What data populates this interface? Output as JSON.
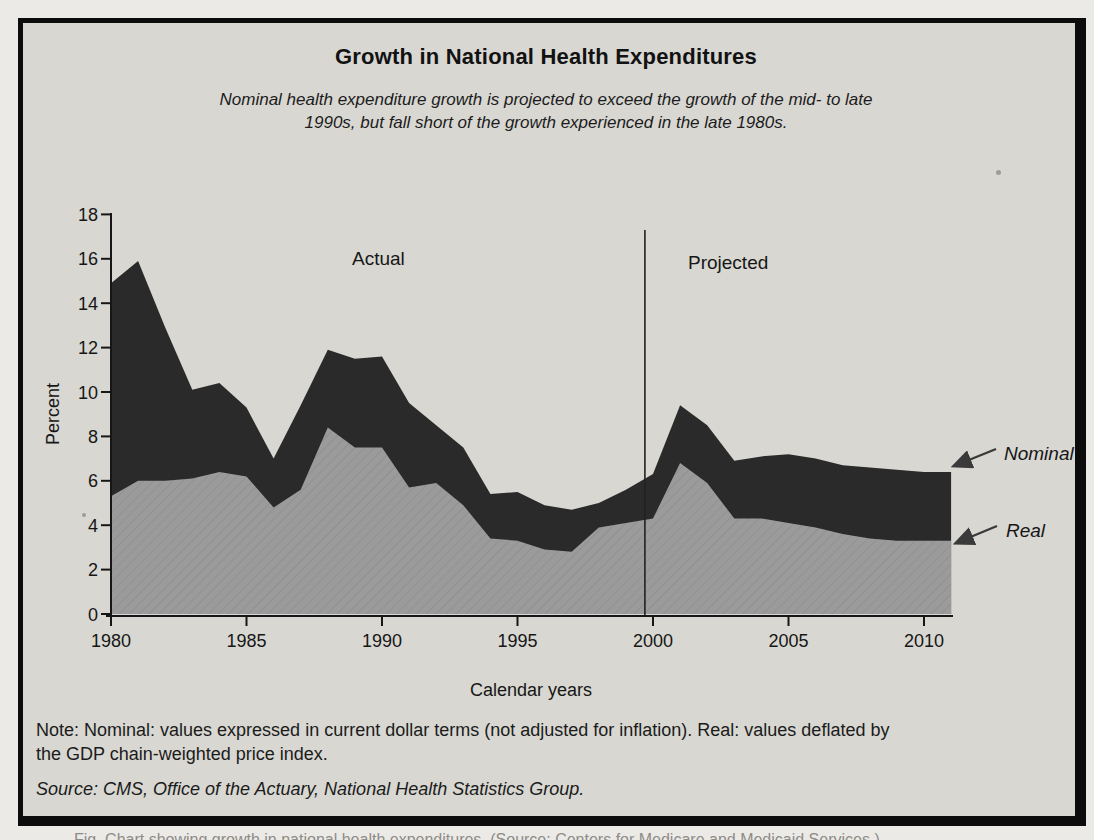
{
  "figure": {
    "title": "Growth in National Health Expenditures",
    "subtitle1": "Nominal health expenditure growth is projected to exceed the growth of the mid- to late",
    "subtitle2": "1990s, but fall short of the growth experienced in the late 1980s.",
    "note1": "Note: Nominal: values expressed in current dollar terms (not adjusted for inflation). Real: values deflated by",
    "note2": "the GDP chain-weighted price index.",
    "source": "Source: CMS, Office of the Actuary, National Health Statistics Group.",
    "caption_fragment": "Fig.      Chart showing growth in national health expenditures. (Source: Centers for Medicare and Medicaid Services.)"
  },
  "chart_data": {
    "type": "area",
    "title": "Growth in National Health Expenditures",
    "xlabel": "Calendar years",
    "ylabel": "Percent",
    "xlim": [
      1980,
      2011
    ],
    "ylim": [
      0,
      18
    ],
    "grid": false,
    "legend_position": "right-arrow-annotations",
    "xticks": [
      1980,
      1985,
      1990,
      1995,
      2000,
      2005,
      2010
    ],
    "yticks": [
      0,
      2,
      4,
      6,
      8,
      10,
      12,
      14,
      16,
      18
    ],
    "x_years": [
      1980,
      1981,
      1982,
      1983,
      1984,
      1985,
      1986,
      1987,
      1988,
      1989,
      1990,
      1991,
      1992,
      1993,
      1994,
      1995,
      1996,
      1997,
      1998,
      1999,
      2000,
      2001,
      2002,
      2003,
      2004,
      2005,
      2006,
      2007,
      2008,
      2009,
      2010,
      2011
    ],
    "series": [
      {
        "name": "Nominal",
        "color": "#2a2a2a",
        "values": [
          14.9,
          15.9,
          12.9,
          10.1,
          10.4,
          9.3,
          7.0,
          9.4,
          11.9,
          11.5,
          11.6,
          9.5,
          8.5,
          7.5,
          5.4,
          5.5,
          4.9,
          4.7,
          5.0,
          5.6,
          6.3,
          9.4,
          8.5,
          6.9,
          7.1,
          7.2,
          7.0,
          6.7,
          6.6,
          6.5,
          6.4,
          6.4
        ]
      },
      {
        "name": "Real",
        "color": "#9b9b9b",
        "values": [
          5.3,
          6.0,
          6.0,
          6.1,
          6.4,
          6.2,
          4.8,
          5.6,
          8.4,
          7.5,
          7.5,
          5.7,
          5.9,
          4.9,
          3.4,
          3.3,
          2.9,
          2.8,
          3.9,
          4.1,
          4.3,
          6.8,
          5.9,
          4.3,
          4.3,
          4.1,
          3.9,
          3.6,
          3.4,
          3.3,
          3.3,
          3.3
        ]
      }
    ],
    "annotations": {
      "actual": "Actual",
      "projected": "Projected",
      "nominal": "Nominal",
      "real": "Real",
      "divider_year": 1999.7
    },
    "colors": {
      "frame_border": "#0c0c0c",
      "panel_background": "#d8d7d2",
      "page_background": "#eceae6",
      "axis": "#161616"
    }
  }
}
